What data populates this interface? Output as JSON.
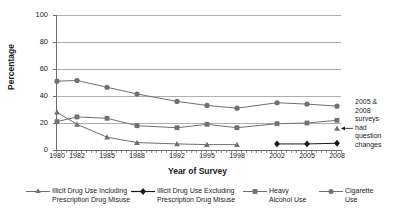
{
  "chart_data": {
    "type": "line",
    "title": "",
    "xlabel": "Year of Survey",
    "ylabel": "Percentage",
    "ylim": [
      0,
      100
    ],
    "yticks": [
      0,
      20,
      40,
      60,
      80,
      100
    ],
    "grid": true,
    "legend_position": "bottom",
    "categories": [
      1980,
      1982,
      1985,
      1988,
      1992,
      1995,
      1998,
      2002,
      2005,
      2008
    ],
    "x_tick_labels": [
      "1980",
      "1982",
      "1985",
      "1988",
      "1992",
      "1995",
      "1998",
      "2002",
      "2005",
      "2008"
    ],
    "y_tick_labels": [
      "0",
      "20",
      "40",
      "60",
      "80",
      "100"
    ],
    "series": [
      {
        "name": "Illicit Drug Use Including Prescription Drug Misuse",
        "marker": "triangle",
        "color": "#707070",
        "values": [
          28,
          19,
          9.5,
          5.5,
          4.5,
          4,
          4,
          null,
          null,
          16
        ]
      },
      {
        "name": "Illicit Drug Use Excluding Prescription Drug Misuse",
        "marker": "diamond",
        "color": "#1a1a1a",
        "values": [
          null,
          null,
          null,
          null,
          null,
          null,
          null,
          4.5,
          4.5,
          5
        ]
      },
      {
        "name": "Heavy Alcohol Use",
        "marker": "square",
        "color": "#707070",
        "values": [
          21,
          24.5,
          23.5,
          18,
          16.5,
          19,
          16.5,
          19.5,
          20,
          22
        ]
      },
      {
        "name": "Cigarette Use",
        "marker": "circle",
        "color": "#707070",
        "values": [
          51,
          51.5,
          46.5,
          41.5,
          36,
          33,
          31,
          35,
          34,
          32.5
        ]
      }
    ],
    "annotations": [
      {
        "text": "2005 & 2008 surveys had question changes",
        "lines": [
          "2005 &",
          "2008",
          "surveys",
          "had",
          "question",
          "changes"
        ],
        "points_to": "triangle-2008"
      }
    ]
  },
  "legend": {
    "items": [
      {
        "label_line1": "Illicit Drug Use Including",
        "label_line2": "Prescription Drug Misuse",
        "marker": "triangle-marker-icon"
      },
      {
        "label_line1": "Illicit Drug Use Excluding",
        "label_line2": "Prescription Drug Misuse",
        "marker": "diamond-marker-icon"
      },
      {
        "label_line1": "Heavy",
        "label_line2": "Alcohol Use",
        "marker": "square-marker-icon"
      },
      {
        "label_line1": "Cigarette",
        "label_line2": "Use",
        "marker": "circle-marker-icon"
      }
    ]
  },
  "colors": {
    "grid": "#9a9a9a",
    "axis": "#6e6e6e",
    "series_gray": "#707070",
    "series_black": "#1a1a1a",
    "text": "#1a1a1a"
  }
}
